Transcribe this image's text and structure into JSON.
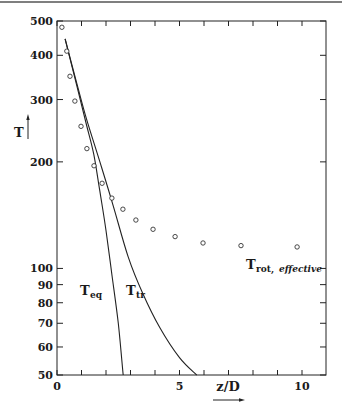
{
  "chart_data": {
    "type": "line",
    "title": "",
    "xlabel": "z/D",
    "ylabel": "T",
    "xlim": [
      0,
      11
    ],
    "ylim": [
      50,
      500
    ],
    "yscale": "log",
    "grid": false,
    "legend": "inline labels",
    "x_ticks": [
      0,
      1,
      2,
      3,
      4,
      5,
      6,
      7,
      8,
      9,
      10
    ],
    "x_tick_labels": [
      {
        "value": 0,
        "label": "0"
      },
      {
        "value": 5,
        "label": "5"
      },
      {
        "value": 10,
        "label": "10"
      }
    ],
    "y_tick_labels": [
      {
        "value": 500,
        "label": "500"
      },
      {
        "value": 400,
        "label": "400"
      },
      {
        "value": 300,
        "label": "300"
      },
      {
        "value": 200,
        "label": "200"
      },
      {
        "value": 100,
        "label": "100"
      },
      {
        "value": 90,
        "label": "90"
      },
      {
        "value": 80,
        "label": "80"
      },
      {
        "value": 70,
        "label": "70"
      },
      {
        "value": 60,
        "label": "60"
      },
      {
        "value": 50,
        "label": "50"
      }
    ],
    "series": [
      {
        "name": "T_eq",
        "label_main": "T",
        "label_sub": "eq",
        "style": "line",
        "x": [
          0.33,
          0.8,
          1.2,
          1.5,
          1.75,
          2.0,
          2.25,
          2.5,
          2.7
        ],
        "y": [
          445,
          330,
          255,
          210,
          165,
          128,
          95,
          70,
          50
        ]
      },
      {
        "name": "T_tr",
        "label_main": "T",
        "label_sub": "tr",
        "style": "line",
        "x": [
          0.33,
          0.8,
          1.2,
          1.75,
          2.3,
          2.9,
          3.5,
          4.2,
          5.0,
          5.7
        ],
        "y": [
          445,
          335,
          265,
          200,
          150,
          108,
          85,
          68,
          56,
          50
        ]
      },
      {
        "name": "T_rot, effective",
        "label_main": "T",
        "label_sub": "rot,",
        "label_sub_italic": "effective",
        "style": "markers-open-circle",
        "x": [
          0.2,
          0.4,
          0.53,
          0.73,
          0.98,
          1.22,
          1.51,
          1.84,
          2.24,
          2.69,
          3.22,
          3.92,
          4.82,
          5.96,
          7.51,
          9.8
        ],
        "y": [
          480,
          411,
          349,
          297,
          252,
          218,
          195,
          174,
          158,
          147,
          137,
          129,
          123,
          118,
          116,
          115
        ]
      }
    ],
    "annotations": [
      {
        "text": "T_eq",
        "x": 0.95,
        "y": 88
      },
      {
        "text": "T_tr",
        "x": 2.6,
        "y": 88
      },
      {
        "text": "T_rot, effective",
        "x": 7.6,
        "y": 105
      }
    ]
  },
  "axes": {
    "x_title": "z/D",
    "y_title": "T"
  }
}
